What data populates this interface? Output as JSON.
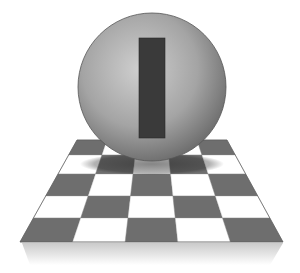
{
  "illustration": {
    "subject": "sphere with vertical bar on checkerboard floor",
    "floor": {
      "rows": 5,
      "columns": 5,
      "dark_color": "#6e6e6e",
      "light_color": "#ffffff",
      "edge_color": "#555555"
    },
    "sphere": {
      "highlight_color": "#c8c8c8",
      "shade_color": "#6a6a6a"
    },
    "bar": {
      "color": "#3a3a3a"
    },
    "shadow": {
      "color": "#333333"
    }
  }
}
